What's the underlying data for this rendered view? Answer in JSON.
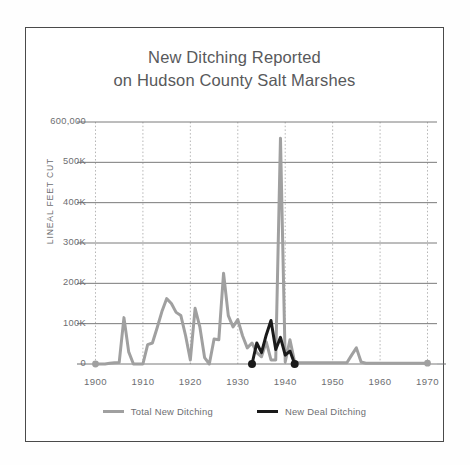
{
  "figure": {
    "title_line_1": "New Ditching Reported",
    "title_line_2": "on Hudson County Salt Marshes",
    "background": "#ffffff",
    "border_color": "#4a4a4a"
  },
  "legend": {
    "position": "bottom-center",
    "entries": [
      {
        "label": "Total New Ditching",
        "color": "#a0a0a0"
      },
      {
        "label": "New Deal Ditching",
        "color": "#1a1a1a"
      }
    ]
  },
  "axes": {
    "y_title": "LINEAL FEET CUT",
    "y_tick_labels": [
      "600,000",
      "500K",
      "400K",
      "300K",
      "200K",
      "100K",
      "0"
    ],
    "y_tick_values": [
      600000,
      500000,
      400000,
      300000,
      200000,
      100000,
      0
    ],
    "x_tick_labels": [
      "1900",
      "1910",
      "1920",
      "1930",
      "1940",
      "1950",
      "1960",
      "1970"
    ],
    "x_tick_values": [
      1900,
      1910,
      1920,
      1930,
      1940,
      1950,
      1960,
      1970
    ],
    "grid": "horizontal solid + vertical dotted",
    "grid_color_horizontal": "#7a7a7a",
    "grid_color_vertical": "#b5b5b5",
    "axis_color": "#6d6e71"
  },
  "chart_data": {
    "type": "line",
    "title": "New Ditching Reported on Hudson County Salt Marshes",
    "xlabel": "",
    "ylabel": "LINEAL FEET CUT",
    "xlim": [
      1898,
      1972
    ],
    "ylim": [
      0,
      600000
    ],
    "xticks": [
      1900,
      1910,
      1920,
      1930,
      1940,
      1950,
      1960,
      1970
    ],
    "yticks": [
      0,
      100000,
      200000,
      300000,
      400000,
      500000,
      600000
    ],
    "grid": true,
    "legend_position": "bottom",
    "series": [
      {
        "name": "Total New Ditching",
        "color": "#a0a0a0",
        "marker_years": [
          1900,
          1970
        ],
        "x": [
          1900,
          1901,
          1902,
          1903,
          1904,
          1905,
          1906,
          1907,
          1908,
          1909,
          1910,
          1911,
          1912,
          1913,
          1914,
          1915,
          1916,
          1917,
          1918,
          1919,
          1920,
          1921,
          1922,
          1923,
          1924,
          1925,
          1926,
          1927,
          1928,
          1929,
          1930,
          1931,
          1932,
          1933,
          1934,
          1935,
          1936,
          1937,
          1938,
          1939,
          1940,
          1941,
          1942,
          1943,
          1944,
          1945,
          1946,
          1947,
          1948,
          1949,
          1950,
          1951,
          1952,
          1953,
          1954,
          1955,
          1956,
          1957,
          1958,
          1959,
          1960,
          1961,
          1962,
          1963,
          1964,
          1965,
          1966,
          1967,
          1968,
          1969,
          1970
        ],
        "y": [
          0,
          0,
          0,
          2000,
          3000,
          4000,
          115000,
          30000,
          0,
          0,
          0,
          48000,
          52000,
          90000,
          130000,
          162000,
          150000,
          128000,
          120000,
          70000,
          10000,
          138000,
          92000,
          16000,
          0,
          62000,
          60000,
          225000,
          120000,
          92000,
          110000,
          70000,
          40000,
          52000,
          28000,
          18000,
          55000,
          10000,
          10000,
          560000,
          5000,
          60000,
          4000,
          3000,
          3000,
          3000,
          3000,
          3000,
          3000,
          3000,
          3000,
          3000,
          3000,
          3000,
          22000,
          40000,
          5000,
          2000,
          2000,
          2000,
          2000,
          2000,
          2000,
          2000,
          2000,
          2000,
          2000,
          2000,
          2000,
          2000,
          2000
        ]
      },
      {
        "name": "New Deal Ditching",
        "color": "#1a1a1a",
        "marker_years": [
          1933,
          1942
        ],
        "x": [
          1933,
          1934,
          1935,
          1936,
          1937,
          1938,
          1939,
          1940,
          1941,
          1942
        ],
        "y": [
          0,
          52000,
          28000,
          72000,
          108000,
          36000,
          66000,
          22000,
          32000,
          0
        ]
      }
    ],
    "annotations": [
      {
        "text": "Peak total ditching spike near 1939",
        "value": 560000
      },
      {
        "text": "Secondary peak 1927",
        "value": 225000
      },
      {
        "text": "Minor postwar bump near 1955",
        "value": 40000
      }
    ]
  }
}
